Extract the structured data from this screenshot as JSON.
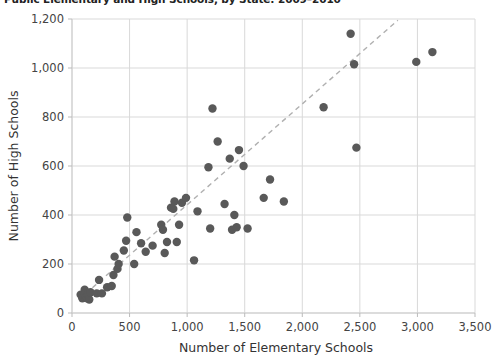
{
  "chart_data": {
    "type": "scatter",
    "title": "Public Elementary and High Schools, by State: 2009–2010",
    "xlabel": "Number of Elementary Schools",
    "ylabel": "Number of High Schools",
    "xlim": [
      0,
      3500
    ],
    "ylim": [
      0,
      1200
    ],
    "xticks": [
      0,
      500,
      1000,
      1500,
      2000,
      2500,
      3000,
      3500
    ],
    "xtick_labels": [
      "0",
      "500",
      "1,000",
      "1,500",
      "2,000",
      "2,500",
      "3,000",
      "3,500"
    ],
    "yticks": [
      0,
      200,
      400,
      600,
      800,
      1000,
      1200
    ],
    "ytick_labels": [
      "0",
      "200",
      "400",
      "600",
      "800",
      "1,000",
      "1,200"
    ],
    "grid": true,
    "legend": "none",
    "marker_color": "#595959",
    "marker_size": 6,
    "trendline": {
      "style": "dashed",
      "color": "#b0b0b0",
      "x": [
        60,
        2830
      ],
      "y": [
        55,
        1195
      ]
    },
    "points": [
      {
        "x": 75,
        "y": 75
      },
      {
        "x": 90,
        "y": 60
      },
      {
        "x": 110,
        "y": 95
      },
      {
        "x": 120,
        "y": 65
      },
      {
        "x": 130,
        "y": 60
      },
      {
        "x": 140,
        "y": 75
      },
      {
        "x": 150,
        "y": 55
      },
      {
        "x": 160,
        "y": 85
      },
      {
        "x": 215,
        "y": 80
      },
      {
        "x": 260,
        "y": 80
      },
      {
        "x": 235,
        "y": 135
      },
      {
        "x": 305,
        "y": 105
      },
      {
        "x": 345,
        "y": 110
      },
      {
        "x": 360,
        "y": 155
      },
      {
        "x": 370,
        "y": 230
      },
      {
        "x": 395,
        "y": 180
      },
      {
        "x": 405,
        "y": 200
      },
      {
        "x": 450,
        "y": 255
      },
      {
        "x": 470,
        "y": 295
      },
      {
        "x": 480,
        "y": 390
      },
      {
        "x": 540,
        "y": 200
      },
      {
        "x": 560,
        "y": 330
      },
      {
        "x": 600,
        "y": 285
      },
      {
        "x": 640,
        "y": 250
      },
      {
        "x": 700,
        "y": 275
      },
      {
        "x": 775,
        "y": 360
      },
      {
        "x": 790,
        "y": 340
      },
      {
        "x": 805,
        "y": 245
      },
      {
        "x": 825,
        "y": 290
      },
      {
        "x": 860,
        "y": 430
      },
      {
        "x": 880,
        "y": 425
      },
      {
        "x": 890,
        "y": 455
      },
      {
        "x": 910,
        "y": 290
      },
      {
        "x": 930,
        "y": 360
      },
      {
        "x": 955,
        "y": 450
      },
      {
        "x": 990,
        "y": 470
      },
      {
        "x": 1060,
        "y": 215
      },
      {
        "x": 1090,
        "y": 415
      },
      {
        "x": 1185,
        "y": 595
      },
      {
        "x": 1200,
        "y": 345
      },
      {
        "x": 1220,
        "y": 835
      },
      {
        "x": 1265,
        "y": 700
      },
      {
        "x": 1325,
        "y": 445
      },
      {
        "x": 1370,
        "y": 630
      },
      {
        "x": 1390,
        "y": 340
      },
      {
        "x": 1410,
        "y": 400
      },
      {
        "x": 1430,
        "y": 350
      },
      {
        "x": 1450,
        "y": 665
      },
      {
        "x": 1490,
        "y": 600
      },
      {
        "x": 1525,
        "y": 345
      },
      {
        "x": 1665,
        "y": 470
      },
      {
        "x": 1720,
        "y": 545
      },
      {
        "x": 1840,
        "y": 455
      },
      {
        "x": 2185,
        "y": 840
      },
      {
        "x": 2420,
        "y": 1140
      },
      {
        "x": 2450,
        "y": 1015
      },
      {
        "x": 2470,
        "y": 675
      },
      {
        "x": 2990,
        "y": 1025
      },
      {
        "x": 3130,
        "y": 1065
      }
    ]
  }
}
